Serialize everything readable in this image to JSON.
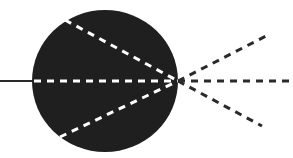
{
  "diagram": {
    "type": "lens-ray-diagram",
    "width": 293,
    "height": 158,
    "background_color": "#ffffff",
    "body": {
      "shape": "circle",
      "cx": 105,
      "cy": 81,
      "rx": 73,
      "ry": 71,
      "fill_color": "#1f1f1f"
    },
    "incoming_line": {
      "x1": 0,
      "y1": 81,
      "x2": 33,
      "y2": 81,
      "color": "#2a2a2a",
      "style": "solid"
    },
    "focal_point": {
      "x": 178,
      "y": 81
    },
    "internal_rays": [
      {
        "x1": 65,
        "y1": 20,
        "x2": 178,
        "y2": 81,
        "color": "#ffffff",
        "style": "dashed"
      },
      {
        "x1": 34,
        "y1": 81,
        "x2": 178,
        "y2": 81,
        "color": "#ffffff",
        "style": "dashed"
      },
      {
        "x1": 60,
        "y1": 137,
        "x2": 178,
        "y2": 81,
        "color": "#ffffff",
        "style": "dashed"
      }
    ],
    "outgoing_rays": [
      {
        "x1": 178,
        "y1": 81,
        "x2": 268,
        "y2": 35,
        "color": "#2a2a2a",
        "style": "dashed"
      },
      {
        "x1": 178,
        "y1": 81,
        "x2": 293,
        "y2": 81,
        "color": "#2a2a2a",
        "style": "dashed"
      },
      {
        "x1": 178,
        "y1": 81,
        "x2": 262,
        "y2": 126,
        "color": "#2a2a2a",
        "style": "dashed"
      }
    ]
  }
}
